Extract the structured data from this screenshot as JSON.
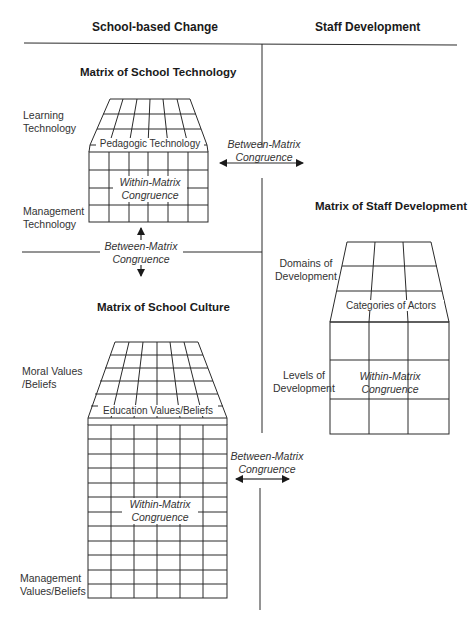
{
  "headers": {
    "left": "School-based Change",
    "right": "Staff Development"
  },
  "technology_matrix": {
    "title": "Matrix of School Technology",
    "top_label": "Learning\nTechnology",
    "top_label_lines": [
      "Learning",
      "Technology"
    ],
    "middle_label": "Pedagogic Technology",
    "bottom_label_lines": [
      "Management",
      "Technology"
    ],
    "within_lines": [
      "Within-Matrix",
      "Congruence"
    ]
  },
  "between_tech_staff": {
    "lines": [
      "Between-Matrix",
      "Congruence"
    ],
    "arrow": "double-horizontal"
  },
  "between_tech_culture": {
    "lines": [
      "Between-Matrix",
      "Congruence"
    ],
    "arrow": "double-vertical"
  },
  "staff_matrix": {
    "title": "Matrix of Staff Development",
    "top_label_lines": [
      "Domains of",
      "Development"
    ],
    "middle_label": "Categories of Actors",
    "bottom_label_lines": [
      "Levels of",
      "Development"
    ],
    "within_lines": [
      "Within-Matrix",
      "Congruence"
    ]
  },
  "culture_matrix": {
    "title": "Matrix of School Culture",
    "top_label_lines": [
      "Moral Values",
      "/Beliefs"
    ],
    "middle_label": "Education Values/Beliefs",
    "bottom_label_lines": [
      "Management",
      "Values/Beliefs"
    ],
    "within_lines": [
      "Within-Matrix",
      "Congruence"
    ]
  },
  "between_culture_staff": {
    "lines": [
      "Between-Matrix",
      "Congruence"
    ],
    "arrow": "double-horizontal"
  },
  "colors": {
    "line": "#2a2a2a",
    "text": "#333333",
    "background": "#ffffff"
  }
}
